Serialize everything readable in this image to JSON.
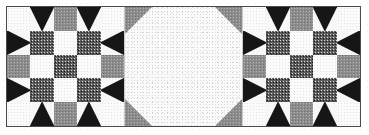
{
  "figure": {
    "width": 369,
    "height": 135,
    "border_color": "#4a4a4a",
    "background_color": "#ffffff"
  },
  "palette": {
    "dark": "#161616",
    "gray": "#8d8d8d",
    "speckle": "#5d5d5d",
    "white": "#fbfbfb"
  },
  "legend": {
    "dark_label": "dark solid",
    "gray_label": "medium gray print",
    "speckle_label": "dark speckled print",
    "white_label": "light background"
  },
  "blocks": [
    {
      "name": "left-star-block",
      "label": "Left sawtooth star block",
      "columns": 5,
      "rows": 5,
      "cells": [
        "white",
        "geese-up",
        "gray",
        "geese-up",
        "white",
        "geese-left",
        "speckle",
        "white",
        "speckle",
        "geese-right",
        "gray",
        "white",
        "speckle",
        "white",
        "gray",
        "geese-left",
        "speckle",
        "white",
        "speckle",
        "geese-right",
        "white",
        "geese-down",
        "gray",
        "geese-down",
        "white"
      ]
    },
    {
      "name": "right-star-block",
      "label": "Right sawtooth star block",
      "columns": 5,
      "rows": 5,
      "cells": [
        "white",
        "geese-up",
        "gray",
        "geese-up",
        "white",
        "geese-left",
        "speckle",
        "white",
        "speckle",
        "geese-right",
        "gray",
        "white",
        "speckle",
        "white",
        "gray",
        "geese-left",
        "speckle",
        "white",
        "speckle",
        "geese-right",
        "white",
        "geese-down",
        "gray",
        "geese-down",
        "white"
      ]
    }
  ],
  "center": {
    "name": "center-octagon-panel",
    "label": "Center octagon panel",
    "shape": "octagon",
    "corner_cut": 28,
    "fill": "white",
    "corner_fill": "gray"
  }
}
